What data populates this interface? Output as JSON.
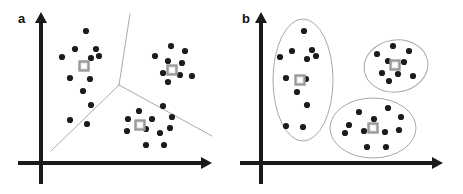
{
  "figure": {
    "type": "diagram",
    "width": 463,
    "height": 194,
    "background": "#ffffff"
  },
  "colors": {
    "axis": "#1a1a1a",
    "point": "#1c1c1c",
    "boundary": "#aaaaaa",
    "ellipse": "#a8a8a8",
    "centroid_stroke": "#9a9a9a",
    "centroid_fill": "#ededed",
    "label": "#111111"
  },
  "panels": [
    {
      "id": "a",
      "label": "a",
      "label_x": 18,
      "label_y": 12,
      "axes": {
        "y_axis": {
          "x": 41,
          "y_top": 12,
          "y_bottom": 184,
          "arrow": "up"
        },
        "x_axis": {
          "y": 163,
          "x_left": 18,
          "x_right": 212,
          "arrow": "right"
        },
        "stroke_width": 4
      },
      "boundaries": {
        "type": "voronoi",
        "junction": [
          119,
          85
        ],
        "edges": [
          {
            "name": "upper",
            "from": [
              119,
              85
            ],
            "to": [
              130,
              14
            ]
          },
          {
            "name": "lower-left",
            "from": [
              119,
              85
            ],
            "to": [
              51,
              151
            ]
          },
          {
            "name": "lower-right",
            "from": [
              119,
              85
            ],
            "to": [
              212,
              136
            ]
          }
        ],
        "stroke_width": 1
      },
      "clusters": [
        {
          "name": "cluster-left",
          "centroid": [
            84,
            66
          ],
          "points": [
            [
              86,
              31
            ],
            [
              75,
              49
            ],
            [
              96,
              49
            ],
            [
              62,
              57
            ],
            [
              91,
              58
            ],
            [
              99,
              56
            ],
            [
              70,
              78
            ],
            [
              90,
              79
            ],
            [
              83,
              91
            ],
            [
              91,
              105
            ],
            [
              70,
              120
            ],
            [
              87,
              124
            ]
          ]
        },
        {
          "name": "cluster-right",
          "centroid": [
            172,
            70
          ],
          "points": [
            [
              171,
              46
            ],
            [
              185,
              51
            ],
            [
              155,
              56
            ],
            [
              168,
              61
            ],
            [
              182,
              63
            ],
            [
              163,
              73
            ],
            [
              180,
              75
            ],
            [
              192,
              76
            ],
            [
              168,
              82
            ]
          ]
        },
        {
          "name": "cluster-bottom",
          "centroid": [
            140,
            125
          ],
          "points": [
            [
              139,
              111
            ],
            [
              163,
              106
            ],
            [
              152,
              119
            ],
            [
              128,
              119
            ],
            [
              172,
              117
            ],
            [
              146,
              129
            ],
            [
              127,
              131
            ],
            [
              160,
              133
            ],
            [
              170,
              128
            ],
            [
              146,
              145
            ],
            [
              164,
              145
            ]
          ]
        }
      ]
    },
    {
      "id": "b",
      "label": "b",
      "label_x": 242,
      "label_y": 12,
      "axes": {
        "y_axis": {
          "x": 261,
          "y_top": 12,
          "y_bottom": 184,
          "arrow": "up"
        },
        "x_axis": {
          "y": 163,
          "x_left": 240,
          "x_right": 443,
          "arrow": "right"
        },
        "stroke_width": 4
      },
      "clusters": [
        {
          "name": "cluster-left",
          "ellipse": {
            "cx": 303,
            "cy": 80,
            "rx": 30,
            "ry": 61,
            "rotation": 0
          },
          "centroid": [
            300,
            80
          ],
          "points": [
            [
              304,
              31
            ],
            [
              292,
              51
            ],
            [
              312,
              50
            ],
            [
              280,
              57
            ],
            [
              307,
              59
            ],
            [
              316,
              56
            ],
            [
              286,
              78
            ],
            [
              306,
              79
            ],
            [
              297,
              92
            ],
            [
              307,
              105
            ],
            [
              286,
              126
            ],
            [
              303,
              127
            ]
          ]
        },
        {
          "name": "cluster-top-right",
          "ellipse": {
            "cx": 396,
            "cy": 66,
            "rx": 32,
            "ry": 26,
            "rotation": -8
          },
          "centroid": [
            395,
            65
          ],
          "points": [
            [
              393,
              46
            ],
            [
              409,
              51
            ],
            [
              377,
              54
            ],
            [
              388,
              61
            ],
            [
              404,
              62
            ],
            [
              382,
              73
            ],
            [
              398,
              74
            ],
            [
              413,
              76
            ],
            [
              389,
              81
            ]
          ]
        },
        {
          "name": "cluster-bottom-right",
          "ellipse": {
            "cx": 373,
            "cy": 128,
            "rx": 43,
            "ry": 30,
            "rotation": 0
          },
          "centroid": [
            373,
            128
          ],
          "points": [
            [
              359,
              112
            ],
            [
              388,
              108
            ],
            [
              374,
              119
            ],
            [
              349,
              125
            ],
            [
              401,
              117
            ],
            [
              364,
              131
            ],
            [
              345,
              133
            ],
            [
              385,
              132
            ],
            [
              399,
              130
            ],
            [
              367,
              147
            ],
            [
              386,
              147
            ]
          ]
        }
      ]
    }
  ],
  "markers": {
    "point_radius": 3.1,
    "centroid_size": 9,
    "centroid_inner": 4
  }
}
